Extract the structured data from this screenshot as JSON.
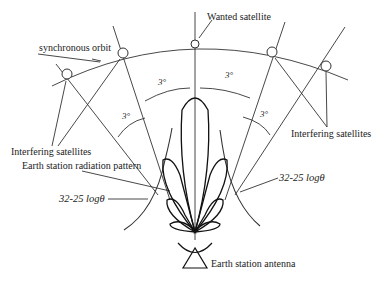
{
  "diagram": {
    "labels": {
      "wanted_satellite": "Wanted satellite",
      "synchronous_orbit": "synchronous orbit",
      "interfering_left": "Interfering satellites",
      "interfering_right": "Interfering satellites",
      "radiation_pattern": "Earth station radiation pattern",
      "envelope_left": "32-25 logθ",
      "envelope_right": "32-25 logθ",
      "antenna": "Earth station antenna",
      "angle_upper_left": "3°",
      "angle_upper_right": "3°",
      "angle_lower_left": "3°",
      "angle_lower_right": "3°"
    },
    "satellites": [
      {
        "name": "interfering-far-left",
        "x": 67,
        "y": 74
      },
      {
        "name": "interfering-left",
        "x": 123,
        "y": 53
      },
      {
        "name": "wanted",
        "x": 195,
        "y": 44
      },
      {
        "name": "interfering-right",
        "x": 272,
        "y": 52
      },
      {
        "name": "interfering-far-right",
        "x": 326,
        "y": 66
      }
    ],
    "antenna_position": {
      "x": 195,
      "y": 236
    },
    "colors": {
      "line": "#333333",
      "background": "#ffffff"
    }
  }
}
